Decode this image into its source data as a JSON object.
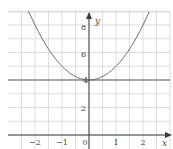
{
  "chart_data": {
    "type": "line",
    "title": "",
    "xlabel": "x",
    "ylabel": "y",
    "xlim": [
      -2.5,
      3
    ],
    "ylim": [
      -0.4,
      9
    ],
    "grid": true,
    "grid_spacing": {
      "x": 0.5,
      "y": 1
    },
    "x_ticks": [
      -2,
      -1,
      0,
      1,
      2
    ],
    "y_ticks": [
      2,
      4,
      6,
      8
    ],
    "x_tick_labels": [
      "−2",
      "−1",
      "0",
      "1",
      "2"
    ],
    "y_tick_labels": [
      "2",
      "4",
      "6",
      "8"
    ],
    "series": [
      {
        "name": "curve",
        "equation": "y = x^2 + 4",
        "x": [
          -2.25,
          -2,
          -1.5,
          -1,
          -0.5,
          0,
          0.5,
          1,
          1.5,
          2,
          2.25
        ],
        "y": [
          9.06,
          8,
          6.25,
          5,
          4.25,
          4,
          4.25,
          5,
          6.25,
          8,
          9.06
        ]
      },
      {
        "name": "horizontal line",
        "equation": "y = 4",
        "x": [
          -2.5,
          3
        ],
        "y": [
          4,
          4
        ]
      }
    ]
  },
  "labels": {
    "x_axis": "x",
    "y_axis": "y",
    "origin": "0",
    "xm2": "−2",
    "xm1": "−1",
    "x1": "1",
    "x2": "2",
    "y2": "2",
    "y4": "4",
    "y6": "6",
    "y8": "8"
  }
}
